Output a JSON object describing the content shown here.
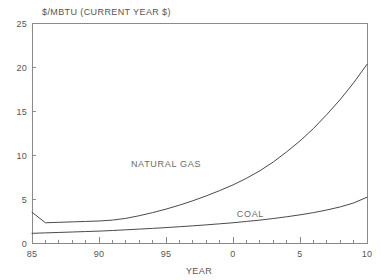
{
  "chart_data": {
    "type": "line",
    "title": "$/MBTU (CURRENT YEAR $)",
    "xlabel": "YEAR",
    "ylabel": "$/MBTU (CURRENT YEAR $)",
    "xlim": [
      1985,
      2010
    ],
    "ylim": [
      0,
      25
    ],
    "grid": false,
    "legend_position": "inline-annotations",
    "x_tick_labels": [
      "85",
      "90",
      "95",
      "0",
      "5",
      "10"
    ],
    "x_tick_values": [
      1985,
      1990,
      1995,
      2000,
      2005,
      2010
    ],
    "y_tick_labels": [
      "0",
      "5",
      "10",
      "15",
      "20",
      "25"
    ],
    "y_tick_values": [
      0,
      5,
      10,
      15,
      20,
      25
    ],
    "minor_x_tick_interval": 1,
    "x": [
      1985,
      1986,
      1987,
      1988,
      1989,
      1990,
      1991,
      1992,
      1993,
      1994,
      1995,
      1996,
      1997,
      1998,
      1999,
      2000,
      2001,
      2002,
      2003,
      2004,
      2005,
      2006,
      2007,
      2008,
      2009,
      2010
    ],
    "series": [
      {
        "name": "NATURAL GAS",
        "label": "NATURAL GAS",
        "color": "#4a4a4a",
        "label_x": 1995.0,
        "label_y": 8.6,
        "values": [
          3.5,
          2.3,
          2.35,
          2.4,
          2.45,
          2.5,
          2.6,
          2.8,
          3.1,
          3.45,
          3.85,
          4.3,
          4.8,
          5.35,
          5.95,
          6.6,
          7.35,
          8.2,
          9.2,
          10.35,
          11.6,
          13.0,
          14.6,
          16.3,
          18.2,
          20.3
        ]
      },
      {
        "name": "COAL",
        "label": "COAL",
        "color": "#4a4a4a",
        "label_x": 2001.3,
        "label_y": 2.95,
        "values": [
          1.1,
          1.15,
          1.2,
          1.25,
          1.3,
          1.35,
          1.42,
          1.5,
          1.58,
          1.66,
          1.75,
          1.85,
          1.95,
          2.06,
          2.18,
          2.3,
          2.45,
          2.6,
          2.78,
          2.98,
          3.2,
          3.45,
          3.75,
          4.1,
          4.55,
          5.2
        ]
      }
    ]
  }
}
